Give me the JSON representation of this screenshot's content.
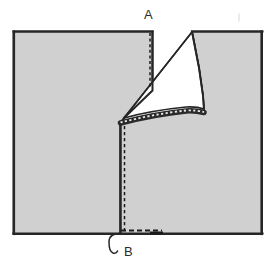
{
  "figure": {
    "background_color": "#ffffff",
    "fabric_fill": "#d0d0d0",
    "fabric_underside_fill": "#ffffff",
    "outline_color": "#262626",
    "stitch_color": "#1a1a1a",
    "label_color": "#2b2b2b"
  },
  "labels": {
    "top": "A",
    "bottom": "B"
  },
  "panels": {
    "left_panel_name": "left fabric panel",
    "right_panel_name": "right fabric panel",
    "fold_flap_name": "folded-back flap (wrong side shown)"
  },
  "annotations": {
    "leader_line_b_name": "leader line pointing to bottom seam end",
    "vertical_seam_name": "vertical stitched seam",
    "curved_seam_name": "curved stitched seam",
    "bottom_seam_name": "horizontal stitched seam at hem"
  }
}
